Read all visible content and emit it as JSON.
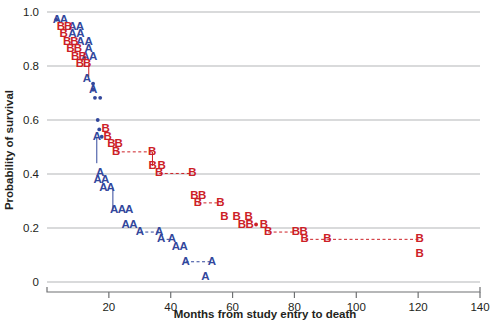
{
  "chart_data": {
    "type": "line",
    "title": "",
    "xlabel": "Months from study entry to death",
    "ylabel": "Probability of survival",
    "xlim": [
      0,
      140
    ],
    "ylim": [
      0,
      1.0
    ],
    "xticks": [
      20,
      40,
      60,
      80,
      100,
      120,
      140
    ],
    "xtick_labels": [
      "20",
      "40",
      "60",
      "80",
      "100",
      "120",
      "140"
    ],
    "yticks": [
      0,
      0.2,
      0.4,
      0.6,
      0.8,
      1.0
    ],
    "ytick_labels": [
      "0",
      "0.2",
      "0.4",
      "0.6",
      "0.8",
      "1.0"
    ],
    "grid": true,
    "legend_position": "none",
    "series": [
      {
        "name": "A",
        "marker": "A",
        "color": "#32479c",
        "points": [
          {
            "x": 3.2,
            "y": 0.972
          },
          {
            "x": 5.5,
            "y": 0.972
          },
          {
            "x": 8.2,
            "y": 0.945
          },
          {
            "x": 10.6,
            "y": 0.945
          },
          {
            "x": 8.2,
            "y": 0.917
          },
          {
            "x": 10.8,
            "y": 0.917
          },
          {
            "x": 10.8,
            "y": 0.888
          },
          {
            "x": 13.5,
            "y": 0.888
          },
          {
            "x": 13.5,
            "y": 0.862
          },
          {
            "x": 12.4,
            "y": 0.835
          },
          {
            "x": 14.9,
            "y": 0.835
          },
          {
            "x": 12.9,
            "y": 0.753
          },
          {
            "x": 14.9,
            "y": 0.713
          },
          {
            "x": 16.1,
            "y": 0.538
          },
          {
            "x": 17.2,
            "y": 0.405
          },
          {
            "x": 16.4,
            "y": 0.377
          },
          {
            "x": 18.8,
            "y": 0.377
          },
          {
            "x": 18.2,
            "y": 0.35
          },
          {
            "x": 20.6,
            "y": 0.35
          },
          {
            "x": 21.7,
            "y": 0.268
          },
          {
            "x": 24.2,
            "y": 0.268
          },
          {
            "x": 26.6,
            "y": 0.268
          },
          {
            "x": 25.4,
            "y": 0.213
          },
          {
            "x": 27.9,
            "y": 0.213
          },
          {
            "x": 30.0,
            "y": 0.185
          },
          {
            "x": 36.3,
            "y": 0.185
          },
          {
            "x": 36.9,
            "y": 0.158
          },
          {
            "x": 40.4,
            "y": 0.158
          },
          {
            "x": 41.7,
            "y": 0.13
          },
          {
            "x": 44.2,
            "y": 0.13
          },
          {
            "x": 44.8,
            "y": 0.075
          },
          {
            "x": 53.3,
            "y": 0.075
          },
          {
            "x": 51.2,
            "y": 0.018
          }
        ],
        "censored": [
          {
            "x": 14.9,
            "y": 0.735
          }
        ]
      },
      {
        "name": "B",
        "marker": "B",
        "color": "#cc2026",
        "points": [
          {
            "x": 4.5,
            "y": 0.945
          },
          {
            "x": 6.8,
            "y": 0.945
          },
          {
            "x": 5.4,
            "y": 0.917
          },
          {
            "x": 6.5,
            "y": 0.888
          },
          {
            "x": 8.9,
            "y": 0.888
          },
          {
            "x": 7.6,
            "y": 0.862
          },
          {
            "x": 10.0,
            "y": 0.862
          },
          {
            "x": 9.1,
            "y": 0.835
          },
          {
            "x": 11.5,
            "y": 0.835
          },
          {
            "x": 10.6,
            "y": 0.808
          },
          {
            "x": 13.0,
            "y": 0.808
          },
          {
            "x": 19.0,
            "y": 0.565
          },
          {
            "x": 19.6,
            "y": 0.538
          },
          {
            "x": 20.8,
            "y": 0.51
          },
          {
            "x": 23.2,
            "y": 0.51
          },
          {
            "x": 22.4,
            "y": 0.482
          },
          {
            "x": 34.0,
            "y": 0.482
          },
          {
            "x": 34.2,
            "y": 0.43
          },
          {
            "x": 37.1,
            "y": 0.43
          },
          {
            "x": 36.3,
            "y": 0.402
          },
          {
            "x": 47.0,
            "y": 0.402
          },
          {
            "x": 47.7,
            "y": 0.32
          },
          {
            "x": 50.2,
            "y": 0.32
          },
          {
            "x": 48.8,
            "y": 0.293
          },
          {
            "x": 56.1,
            "y": 0.293
          },
          {
            "x": 57.4,
            "y": 0.24
          },
          {
            "x": 61.3,
            "y": 0.24
          },
          {
            "x": 65.2,
            "y": 0.24
          },
          {
            "x": 63.0,
            "y": 0.213
          },
          {
            "x": 65.5,
            "y": 0.213
          },
          {
            "x": 70.1,
            "y": 0.213
          },
          {
            "x": 71.5,
            "y": 0.185
          },
          {
            "x": 80.5,
            "y": 0.185
          },
          {
            "x": 83.0,
            "y": 0.185
          },
          {
            "x": 83.3,
            "y": 0.158
          },
          {
            "x": 90.7,
            "y": 0.158
          },
          {
            "x": 120.5,
            "y": 0.158
          },
          {
            "x": 120.5,
            "y": 0.105
          }
        ],
        "censored": [
          {
            "x": 67.6,
            "y": 0.213
          }
        ]
      }
    ],
    "shared_censored": [
      {
        "x": 3.0,
        "y": 0.972
      },
      {
        "x": 14.9,
        "y": 0.713
      },
      {
        "x": 15.5,
        "y": 0.682
      },
      {
        "x": 17.2,
        "y": 0.682
      },
      {
        "x": 16.4,
        "y": 0.6
      },
      {
        "x": 16.9,
        "y": 0.565
      },
      {
        "x": 17.7,
        "y": 0.538
      }
    ],
    "connectors_a": [
      {
        "x1": 30.0,
        "y1": 0.185,
        "x2": 36.3,
        "y2": 0.185
      },
      {
        "x1": 36.9,
        "y1": 0.158,
        "x2": 40.4,
        "y2": 0.158
      },
      {
        "x1": 44.8,
        "y1": 0.075,
        "x2": 53.3,
        "y2": 0.075
      },
      {
        "x1": 21.3,
        "y1": 0.35,
        "x2": 21.3,
        "y2": 0.268,
        "vertical": true
      },
      {
        "x1": 16.1,
        "y1": 0.538,
        "x2": 16.1,
        "y2": 0.44,
        "vertical": true
      }
    ],
    "connectors_b": [
      {
        "x1": 22.4,
        "y1": 0.482,
        "x2": 34.0,
        "y2": 0.482
      },
      {
        "x1": 36.3,
        "y1": 0.402,
        "x2": 47.0,
        "y2": 0.402
      },
      {
        "x1": 48.8,
        "y1": 0.293,
        "x2": 56.1,
        "y2": 0.293
      },
      {
        "x1": 71.5,
        "y1": 0.185,
        "x2": 80.5,
        "y2": 0.185
      },
      {
        "x1": 83.3,
        "y1": 0.158,
        "x2": 90.7,
        "y2": 0.158
      },
      {
        "x1": 90.7,
        "y1": 0.158,
        "x2": 120.5,
        "y2": 0.158
      },
      {
        "x1": 34.1,
        "y1": 0.482,
        "x2": 34.1,
        "y2": 0.43,
        "vertical": true
      },
      {
        "x1": 13.5,
        "y1": 0.808,
        "x2": 13.5,
        "y2": 0.76,
        "vertical": true
      }
    ]
  }
}
